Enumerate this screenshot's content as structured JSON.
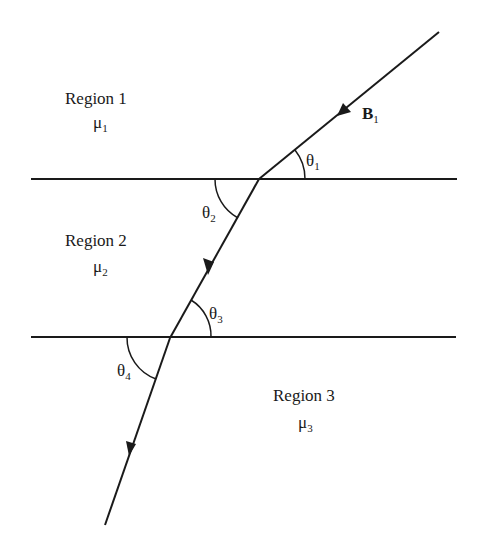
{
  "diagram": {
    "type": "magnetic-field-refraction-at-boundaries",
    "colors": {
      "line": "#1a1a1a",
      "background": "#ffffff"
    },
    "regions": [
      {
        "label": "Region 1",
        "mu_symbol": "μ",
        "mu_sub": "1"
      },
      {
        "label": "Region 2",
        "mu_symbol": "μ",
        "mu_sub": "2"
      },
      {
        "label": "Region 3",
        "mu_symbol": "μ",
        "mu_sub": "3"
      }
    ],
    "field": {
      "symbol": "B",
      "sub": "1"
    },
    "angles": [
      {
        "symbol": "θ",
        "sub": "1"
      },
      {
        "symbol": "θ",
        "sub": "2"
      },
      {
        "symbol": "θ",
        "sub": "3"
      },
      {
        "symbol": "θ",
        "sub": "4"
      }
    ],
    "boundaries": [
      {
        "y": 179,
        "x_start": 31,
        "x_end": 457
      },
      {
        "y": 337,
        "x_start": 31,
        "x_end": 456
      }
    ],
    "ray_points": [
      [
        439,
        32
      ],
      [
        259,
        179
      ],
      [
        170,
        338
      ],
      [
        105,
        525
      ]
    ]
  }
}
